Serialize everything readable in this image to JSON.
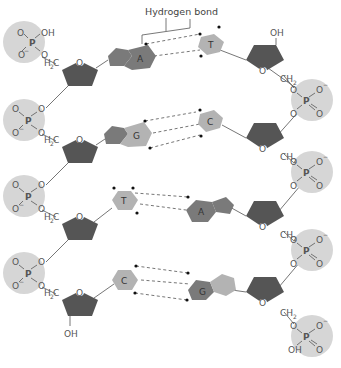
{
  "title": "Hydrogen bond",
  "colors": {
    "phosphate_fill": "#d6d6d6",
    "sugar_fill": "#555555",
    "purine_fill": "#7a7a7a",
    "pyrimidine_fill": "#b3b3b3",
    "line": "#666666",
    "text": "#555555"
  },
  "atoms": {
    "O": "O",
    "P": "P",
    "OH": "OH",
    "O_minus": "O",
    "minus": "−",
    "H": "H",
    "C": "C",
    "CH": "CH",
    "two": "2"
  },
  "base_pairs": [
    {
      "left": "A",
      "right": "T",
      "hydrogen_bonds": 2
    },
    {
      "left": "G",
      "right": "C",
      "hydrogen_bonds": 3
    },
    {
      "left": "T",
      "right": "A",
      "hydrogen_bonds": 2
    },
    {
      "left": "C",
      "right": "G",
      "hydrogen_bonds": 3
    }
  ],
  "left_strand": {
    "top_phosphate_terminal": "OH",
    "bottom_sugar_terminal": "OH",
    "linker": "H2C"
  },
  "right_strand": {
    "top_sugar_terminal": "OH",
    "bottom_phosphate_terminal": "OH",
    "linker": "CH2"
  }
}
